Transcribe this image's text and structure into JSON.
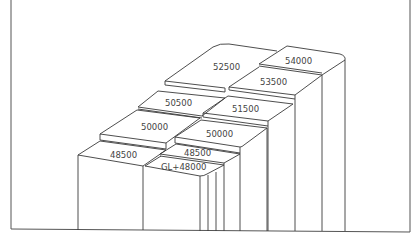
{
  "diagram": {
    "type": "stepped-platform-elevations",
    "labels": [
      {
        "id": "top-left",
        "text": "52500",
        "x": 213,
        "y": 70
      },
      {
        "id": "top-right",
        "text": "54000",
        "x": 285,
        "y": 64
      },
      {
        "id": "second-right",
        "text": "53500",
        "x": 260,
        "y": 85
      },
      {
        "id": "mid-left",
        "text": "50500",
        "x": 165,
        "y": 106
      },
      {
        "id": "mid-right",
        "text": "51500",
        "x": 232,
        "y": 112
      },
      {
        "id": "lower-left",
        "text": "50000",
        "x": 141,
        "y": 130
      },
      {
        "id": "lower-right",
        "text": "50000",
        "x": 206,
        "y": 137
      },
      {
        "id": "base-left",
        "text": "48500",
        "x": 110,
        "y": 158
      },
      {
        "id": "base-right",
        "text": "48500",
        "x": 184,
        "y": 156
      },
      {
        "id": "ground",
        "text": "GL+48000",
        "x": 161,
        "y": 170
      }
    ]
  },
  "caption": "",
  "colors": {
    "line": "#3a3a3a",
    "text": "#444444",
    "background": "#ffffff"
  }
}
